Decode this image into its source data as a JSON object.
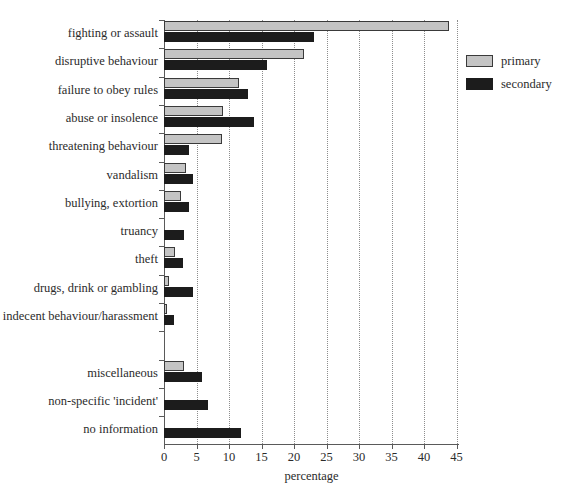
{
  "chart_data": {
    "type": "bar",
    "orientation": "horizontal",
    "title": "",
    "xlabel": "percentage",
    "ylabel": "",
    "xlim": [
      0,
      45
    ],
    "xticks": [
      0,
      5,
      10,
      15,
      20,
      25,
      30,
      35,
      40,
      45
    ],
    "xtick_labels": [
      "0",
      "5",
      "10",
      "15",
      "20",
      "25",
      "30",
      "35",
      "40",
      "45"
    ],
    "grid": "vertical-dotted",
    "legend_position": "top-right",
    "categories": [
      "fighting or assault",
      "disruptive behaviour",
      "failure to obey rules",
      "abuse or insolence",
      "threatening behaviour",
      "vandalism",
      "bullying, extortion",
      "truancy",
      "theft",
      "drugs, drink or gambling",
      "indecent behaviour/harassment",
      "",
      "miscellaneous",
      "non-specific 'incident'",
      "no information"
    ],
    "series": [
      {
        "name": "primary",
        "color": "#c4c4c4",
        "values": [
          43.8,
          21.5,
          11.6,
          9.0,
          8.9,
          3.4,
          2.6,
          0.0,
          1.7,
          0.8,
          0.5,
          0.0,
          3.1,
          0.0,
          0.0
        ]
      },
      {
        "name": "secondary",
        "color": "#1c1c1c",
        "values": [
          23.0,
          15.8,
          12.9,
          13.9,
          3.9,
          4.5,
          3.9,
          3.1,
          2.9,
          4.5,
          1.5,
          0.0,
          5.8,
          6.7,
          11.8
        ]
      }
    ]
  },
  "legend": {
    "entries": [
      {
        "label": "primary"
      },
      {
        "label": "secondary"
      }
    ]
  }
}
